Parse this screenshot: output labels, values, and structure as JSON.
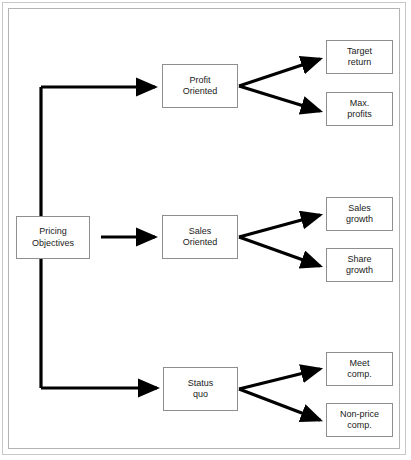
{
  "diagram": {
    "background_color": "#ffffff",
    "frame_color": "#c9c9c9",
    "box_border_color": "#8e8e8e",
    "connector_color": "#000000",
    "root": {
      "label": "Pricing\nObjectives"
    },
    "branches": [
      {
        "label": "Profit\nOriented",
        "leaves": [
          {
            "label": "Target\nreturn"
          },
          {
            "label": "Max.\nprofits"
          }
        ]
      },
      {
        "label": "Sales\nOriented",
        "leaves": [
          {
            "label": "Sales\ngrowth"
          },
          {
            "label": "Share\ngrowth"
          }
        ]
      },
      {
        "label": "Status\nquo",
        "leaves": [
          {
            "label": "Meet\ncomp."
          },
          {
            "label": "Non-price\ncomp."
          }
        ]
      }
    ]
  }
}
